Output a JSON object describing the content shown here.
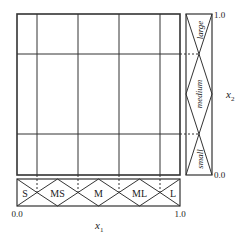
{
  "figure": {
    "x_axis": {
      "label_base": "x",
      "label_sub": "1",
      "tick_min": "0.0",
      "tick_max": "1.0",
      "fuzzy_sets": [
        "S",
        "MS",
        "M",
        "ML",
        "L"
      ]
    },
    "y_axis": {
      "label_base": "x",
      "label_sub": "2",
      "tick_min": "0.0",
      "tick_max": "1.0",
      "fuzzy_sets": [
        "small",
        "medium",
        "large"
      ]
    },
    "grid": {
      "vertical_partitions": 5,
      "horizontal_partitions": 3
    },
    "colors": {
      "line": "#333333",
      "text": "#222222",
      "background": "#ffffff"
    }
  }
}
